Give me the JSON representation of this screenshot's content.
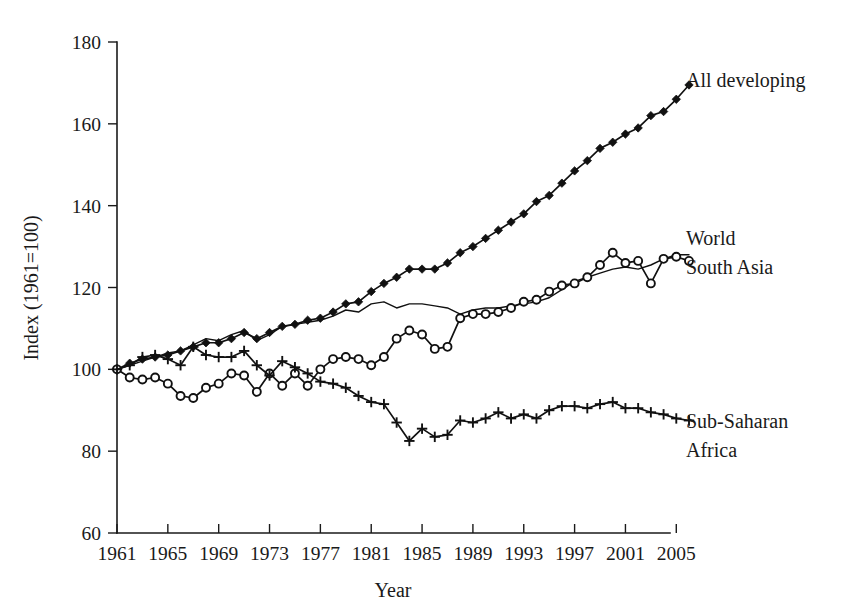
{
  "chart_data": {
    "type": "line",
    "title": "",
    "xlabel": "Year",
    "ylabel": "Index (1961=100)",
    "xlim": [
      1961,
      2006
    ],
    "ylim": [
      60,
      180
    ],
    "grid": false,
    "legend_position": "right-inline",
    "x_ticks": [
      1961,
      1965,
      1969,
      1973,
      1977,
      1981,
      1985,
      1989,
      1993,
      1997,
      2001,
      2005
    ],
    "y_ticks": [
      60,
      80,
      100,
      120,
      140,
      160,
      180
    ],
    "x": [
      1961,
      1962,
      1963,
      1964,
      1965,
      1966,
      1967,
      1968,
      1969,
      1970,
      1971,
      1972,
      1973,
      1974,
      1975,
      1976,
      1977,
      1978,
      1979,
      1980,
      1981,
      1982,
      1983,
      1984,
      1985,
      1986,
      1987,
      1988,
      1989,
      1990,
      1991,
      1992,
      1993,
      1994,
      1995,
      1996,
      1997,
      1998,
      1999,
      2000,
      2001,
      2002,
      2003,
      2004,
      2005,
      2006
    ],
    "series": [
      {
        "name": "All developing",
        "marker": "diamond",
        "label_lines": [
          "All developing"
        ],
        "values": [
          100.0,
          101.5,
          102.5,
          103.0,
          103.5,
          104.5,
          105.5,
          106.5,
          106.5,
          107.5,
          109.0,
          107.5,
          109.0,
          110.5,
          111.0,
          112.0,
          112.5,
          114.0,
          116.0,
          116.5,
          119.0,
          121.0,
          122.5,
          124.5,
          124.5,
          124.5,
          126.0,
          128.5,
          130.0,
          132.0,
          134.0,
          136.0,
          138.0,
          141.0,
          142.5,
          145.5,
          148.5,
          151.0,
          154.0,
          155.5,
          157.5,
          159.0,
          162.0,
          163.0,
          166.0,
          169.5
        ]
      },
      {
        "name": "World",
        "marker": "none",
        "label_lines": [
          "World"
        ],
        "values": [
          100.0,
          101.0,
          102.0,
          103.0,
          104.0,
          104.5,
          106.0,
          107.5,
          107.0,
          108.5,
          109.5,
          107.0,
          108.5,
          110.5,
          111.0,
          111.5,
          112.0,
          113.0,
          114.5,
          114.0,
          116.0,
          116.5,
          115.0,
          116.0,
          116.0,
          115.5,
          115.0,
          113.5,
          114.5,
          115.0,
          115.0,
          115.5,
          116.0,
          116.5,
          117.5,
          119.5,
          121.5,
          122.5,
          123.5,
          124.5,
          125.0,
          124.5,
          125.5,
          127.0,
          128.0,
          128.0
        ]
      },
      {
        "name": "South Asia",
        "marker": "circle",
        "label_lines": [
          "South Asia"
        ],
        "values": [
          100.0,
          98.0,
          97.5,
          98.0,
          96.5,
          93.5,
          93.0,
          95.5,
          96.5,
          99.0,
          98.5,
          94.5,
          99.0,
          96.0,
          99.0,
          96.0,
          100.0,
          102.5,
          103.0,
          102.5,
          101.0,
          103.0,
          107.5,
          109.5,
          108.5,
          105.0,
          105.5,
          112.5,
          113.5,
          113.5,
          114.0,
          115.0,
          116.5,
          117.0,
          119.0,
          120.5,
          121.0,
          122.5,
          125.5,
          128.5,
          126.0,
          126.5,
          121.0,
          127.0,
          127.5,
          126.5
        ]
      },
      {
        "name": "Sub-Saharan Africa",
        "marker": "plus",
        "label_lines": [
          "Sub-Saharan",
          "Africa"
        ],
        "values": [
          100.0,
          101.0,
          103.0,
          103.5,
          102.5,
          101.0,
          105.5,
          103.5,
          103.0,
          103.0,
          104.5,
          101.0,
          98.5,
          102.0,
          100.5,
          99.0,
          97.0,
          96.5,
          95.5,
          93.5,
          92.0,
          91.5,
          87.0,
          82.5,
          85.5,
          83.5,
          84.0,
          87.5,
          87.0,
          88.0,
          89.5,
          88.0,
          89.0,
          88.0,
          90.0,
          91.0,
          91.0,
          90.5,
          91.5,
          92.0,
          90.5,
          90.5,
          89.5,
          89.0,
          88.0,
          87.5
        ]
      }
    ]
  },
  "labels": {
    "all_developing": "All developing",
    "world": "World",
    "south_asia": "South Asia",
    "sub_saharan_1": "Sub-Saharan",
    "sub_saharan_2": "Africa",
    "y_axis_title": "Index (1961=100)",
    "x_axis_title": "Year"
  },
  "colors": {
    "ink": "#111111",
    "background": "#ffffff"
  }
}
